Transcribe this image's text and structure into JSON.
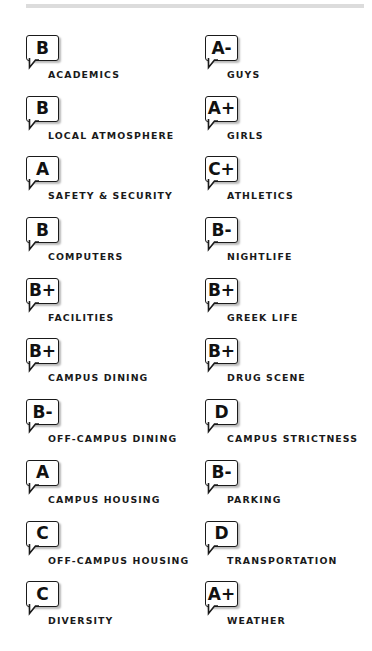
{
  "report_card": {
    "left_column": [
      {
        "category": "ACADEMICS",
        "grade": "B"
      },
      {
        "category": "LOCAL ATMOSPHERE",
        "grade": "B"
      },
      {
        "category": "SAFETY & SECURITY",
        "grade": "A"
      },
      {
        "category": "COMPUTERS",
        "grade": "B"
      },
      {
        "category": "FACILITIES",
        "grade": "B+"
      },
      {
        "category": "CAMPUS DINING",
        "grade": "B+"
      },
      {
        "category": "OFF-CAMPUS DINING",
        "grade": "B-"
      },
      {
        "category": "CAMPUS HOUSING",
        "grade": "A"
      },
      {
        "category": "OFF-CAMPUS HOUSING",
        "grade": "C"
      },
      {
        "category": "DIVERSITY",
        "grade": "C"
      }
    ],
    "right_column": [
      {
        "category": "GUYS",
        "grade": "A-"
      },
      {
        "category": "GIRLS",
        "grade": "A+"
      },
      {
        "category": "ATHLETICS",
        "grade": "C+"
      },
      {
        "category": "NIGHTLIFE",
        "grade": "B-"
      },
      {
        "category": "GREEK LIFE",
        "grade": "B+"
      },
      {
        "category": "DRUG SCENE",
        "grade": "B+"
      },
      {
        "category": "CAMPUS STRICTNESS",
        "grade": "D"
      },
      {
        "category": "PARKING",
        "grade": "B-"
      },
      {
        "category": "TRANSPORTATION",
        "grade": "D"
      },
      {
        "category": "WEATHER",
        "grade": "A+"
      }
    ]
  },
  "icons": {
    "badge": "speech-bubble-icon"
  },
  "colors": {
    "text": "#1a1a1a",
    "border": "#1a1a1a",
    "top_rule": "#dcdcdc",
    "background": "#ffffff"
  }
}
